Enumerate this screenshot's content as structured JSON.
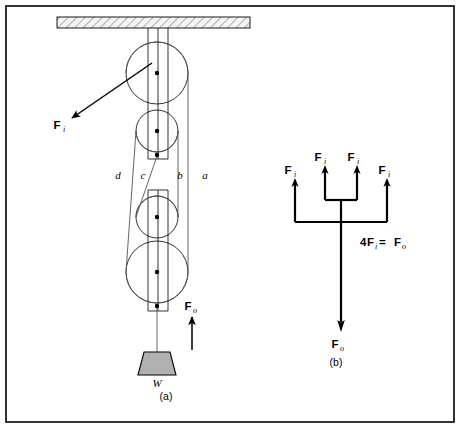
{
  "figure": {
    "border_color": "#000000",
    "background": "#ffffff",
    "panels": [
      {
        "id": "a",
        "caption": "(a)",
        "caption_x": 166,
        "caption_y": 396
      },
      {
        "id": "b",
        "caption": "(b)",
        "caption_x": 332,
        "caption_y": 362
      }
    ]
  },
  "panel_a": {
    "title_caption": "(a)",
    "ceiling": {
      "name": "hatched-ceiling",
      "x": 57,
      "y": 17,
      "width": 193,
      "height": 11,
      "hatch_color": "#707070",
      "fill": "#f2f2f2"
    },
    "pulleys": [
      {
        "name": "upper-large-pulley",
        "cx": 157,
        "cy": 73,
        "r": 31,
        "hub_label": ""
      },
      {
        "name": "upper-small-pulley",
        "cx": 157,
        "cy": 131,
        "r": 21,
        "hub_label": ""
      },
      {
        "name": "lower-small-pulley",
        "cx": 157,
        "cy": 217,
        "r": 21,
        "hub_label": ""
      },
      {
        "name": "lower-large-pulley",
        "cx": 157,
        "cy": 272,
        "r": 31,
        "hub_label": ""
      }
    ],
    "rope_labels": [
      {
        "name": "rope-label-d",
        "text": "d",
        "x": 118,
        "y": 176
      },
      {
        "name": "rope-label-c",
        "text": "c",
        "x": 143,
        "y": 176
      },
      {
        "name": "rope-label-b",
        "text": "b",
        "x": 177,
        "y": 176
      },
      {
        "name": "rope-label-a",
        "text": "a",
        "x": 202,
        "y": 176
      }
    ],
    "force_input": {
      "name": "input-force-label",
      "symbol": "F",
      "subscript": "i",
      "label_x": 57,
      "label_y": 128,
      "arrow_from_x": 152,
      "arrow_from_y": 63,
      "arrow_to_x": 70,
      "arrow_to_y": 119
    },
    "force_output": {
      "name": "output-force-label",
      "symbol": "F",
      "subscript": "o",
      "label_x": 186,
      "label_y": 308,
      "arrow_base_x": 192,
      "arrow_base_y": 350,
      "arrow_tip_x": 192,
      "arrow_tip_y": 315
    },
    "weight": {
      "name": "hanging-weight",
      "label": "W",
      "label_x": 157,
      "label_y": 381,
      "fill": "#b0b0b0",
      "top_y": 352,
      "bottom_y": 375,
      "top_half_width": 13,
      "bottom_half_width": 19,
      "center_x": 157
    }
  },
  "panel_b": {
    "title_caption": "(b)",
    "input_arrows": [
      {
        "name": "fbd-input-force-1",
        "symbol": "F",
        "subscript": "i",
        "x": 295,
        "label_x": 287,
        "label_y": 173,
        "tip_y": 180,
        "base_y": 222
      },
      {
        "name": "fbd-input-force-2",
        "symbol": "F",
        "subscript": "i",
        "x": 325,
        "label_x": 317,
        "label_y": 160,
        "tip_y": 167,
        "base_y": 200
      },
      {
        "name": "fbd-input-force-3",
        "symbol": "F",
        "subscript": "i",
        "x": 357,
        "label_x": 350,
        "label_y": 160,
        "tip_y": 167,
        "base_y": 200
      },
      {
        "name": "fbd-input-force-4",
        "symbol": "F",
        "subscript": "i",
        "x": 387,
        "label_x": 381,
        "label_y": 173,
        "tip_y": 180,
        "base_y": 222
      }
    ],
    "junction": {
      "name": "fbd-junction",
      "stem_x": 341,
      "inner_bar_y": 200,
      "outer_bar_y": 222,
      "stem_top_y": 200
    },
    "equation": {
      "name": "fbd-equation",
      "text_parts": [
        {
          "text": "4",
          "style": "bold"
        },
        {
          "text": "F",
          "style": "bold"
        },
        {
          "text": "i",
          "style": "sub-italic"
        },
        {
          "text": " = ",
          "style": "bold"
        },
        {
          "text": "F",
          "style": "bold"
        },
        {
          "text": "o",
          "style": "sub-italic"
        }
      ],
      "full_text": "4Fᵢ = Fₒ",
      "x": 357,
      "y": 243
    },
    "output_arrow": {
      "name": "fbd-output-force",
      "symbol": "F",
      "subscript": "o",
      "x": 341,
      "base_y": 222,
      "tip_y": 328,
      "label_x": 334,
      "label_y": 348
    }
  }
}
